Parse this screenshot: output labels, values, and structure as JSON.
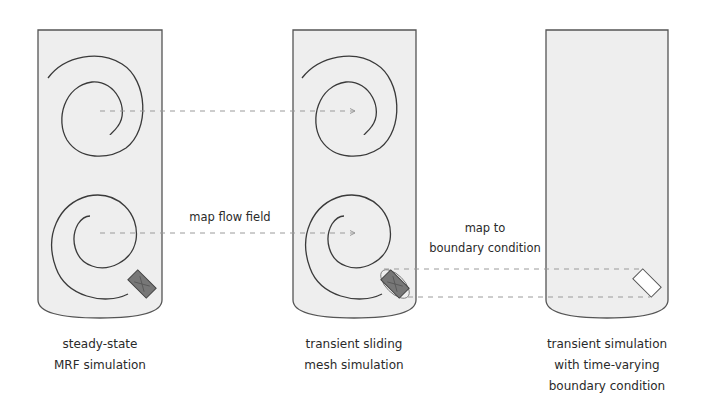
{
  "panels": [
    {
      "id": "mrf",
      "caption": [
        "steady-state",
        "MRF simulation"
      ],
      "has_spirals": true,
      "impeller": "filled",
      "boundary_ring": false
    },
    {
      "id": "sliding",
      "caption": [
        "transient sliding",
        "mesh simulation"
      ],
      "has_spirals": true,
      "impeller": "filled",
      "boundary_ring": true
    },
    {
      "id": "bc",
      "caption": [
        "transient simulation",
        "with time-varying",
        "boundary condition"
      ],
      "has_spirals": false,
      "impeller": "outline",
      "boundary_ring": false
    }
  ],
  "arrows": [
    {
      "label": [
        "map flow field"
      ],
      "style": "dashed",
      "from": "mrf",
      "to": "sliding"
    },
    {
      "label": [
        "map to",
        "boundary condition"
      ],
      "style": "dashed",
      "from": "sliding",
      "to": "bc"
    }
  ],
  "colors": {
    "vessel_fill": "#eeeeee",
    "vessel_stroke": "#555555",
    "spiral_stroke": "#3a3a3a",
    "dash_stroke": "#9a9a9a",
    "impeller_fill": "#777777",
    "impeller_outline_fill": "#ffffff"
  }
}
